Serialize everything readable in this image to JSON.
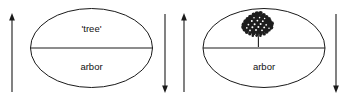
{
  "diagram": {
    "type": "semiotic-sign-pair",
    "canvas": {
      "width": 347,
      "height": 96,
      "background": "#ffffff"
    },
    "stroke_color": "#1a1a1a",
    "text_color": "#111111",
    "signs": [
      {
        "id": "sign-left",
        "name": "sign-left",
        "ellipse": {
          "cx": 91.5,
          "cy": 48,
          "rx": 61,
          "ry": 39.5
        },
        "divider_y": 48,
        "upper_label": "'tree'",
        "upper_label_kind": "text",
        "lower_label": "arbor",
        "lower_label_y": 67,
        "upper_label_y": 29
      },
      {
        "id": "sign-right",
        "name": "sign-right",
        "ellipse": {
          "cx": 264,
          "cy": 48,
          "rx": 61,
          "ry": 39.5
        },
        "divider_y": 48,
        "upper_label": "",
        "upper_label_kind": "tree-illustration",
        "lower_label": "arbor",
        "lower_label_y": 67,
        "upper_label_y": 29
      }
    ],
    "arrows": [
      {
        "id": "arrow-1",
        "name": "arrow-up-left-outer",
        "x": 12,
        "y_top": 14,
        "y_bottom": 92,
        "direction": "up"
      },
      {
        "id": "arrow-2",
        "name": "arrow-down-left-inner",
        "x": 165,
        "y_top": 14,
        "y_bottom": 92,
        "direction": "down"
      },
      {
        "id": "arrow-3",
        "name": "arrow-up-right-inner",
        "x": 184,
        "y_top": 14,
        "y_bottom": 92,
        "direction": "up"
      },
      {
        "id": "arrow-4",
        "name": "arrow-down-right-outer",
        "x": 336,
        "y_top": 14,
        "y_bottom": 92,
        "direction": "down"
      }
    ],
    "tree_illustration": {
      "name": "tree-illustration",
      "center_x": 258,
      "canopy_cy": 27,
      "trunk_top_y": 34,
      "trunk_bottom_y": 47,
      "color": "#1d1d1d"
    }
  }
}
